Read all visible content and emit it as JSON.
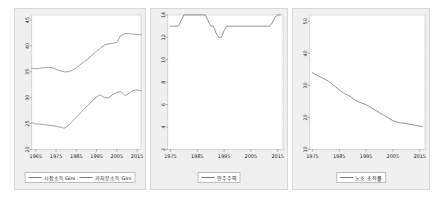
{
  "figure": {
    "panel_count": 3,
    "background_color": "#ffffff",
    "panel_background_color": "#f0f0f0",
    "plot_background_color": "#ffffff",
    "gridline_color": "#ffffff",
    "line_color": "#777777"
  },
  "chart_data": [
    {
      "type": "line",
      "title": "",
      "xlabel": "",
      "ylabel": "",
      "xlim": [
        1963,
        2017
      ],
      "ylim": [
        20,
        46
      ],
      "xticks": [
        1965,
        1975,
        1985,
        1995,
        2005,
        2015
      ],
      "xticklabels": [
        "1965",
        "1975",
        "1985",
        "1995",
        "2005",
        "2015"
      ],
      "yticks": [
        20,
        25,
        30,
        35,
        40,
        45
      ],
      "yticklabels": [
        "20",
        "25",
        "30",
        "35",
        "40",
        "45"
      ],
      "grid": true,
      "legend_position": "below",
      "legend": [
        "시장소득 Gini",
        "가처분소득 Gini"
      ],
      "series": [
        {
          "name": "시장소득 Gini",
          "color": "#8a8a8a",
          "x": [
            1963,
            1965,
            1967,
            1969,
            1971,
            1973,
            1975,
            1977,
            1979,
            1981,
            1983,
            1985,
            1987,
            1989,
            1991,
            1993,
            1995,
            1997,
            1999,
            2001,
            2003,
            2005,
            2007,
            2009,
            2011,
            2013,
            2015,
            2017
          ],
          "values": [
            35.7,
            35.6,
            35.7,
            35.8,
            35.9,
            35.8,
            35.5,
            35.2,
            35.0,
            35.0,
            35.3,
            35.8,
            36.4,
            37.0,
            37.6,
            38.3,
            39.0,
            39.6,
            40.2,
            40.4,
            40.5,
            40.7,
            42.0,
            42.4,
            42.4,
            42.3,
            42.2,
            42.2
          ]
        },
        {
          "name": "가처분소득 Gini",
          "color": "#8a8a8a",
          "x": [
            1963,
            1965,
            1967,
            1969,
            1971,
            1973,
            1975,
            1977,
            1979,
            1981,
            1983,
            1985,
            1987,
            1989,
            1991,
            1993,
            1995,
            1997,
            1999,
            2001,
            2003,
            2005,
            2007,
            2009,
            2011,
            2013,
            2015,
            2017
          ],
          "values": [
            25.2,
            24.9,
            24.9,
            24.8,
            24.7,
            24.6,
            24.5,
            24.3,
            24.1,
            24.6,
            25.4,
            26.2,
            27.0,
            27.9,
            28.6,
            29.4,
            30.2,
            30.5,
            30.0,
            30.0,
            30.6,
            31.0,
            31.2,
            30.4,
            30.8,
            31.4,
            31.5,
            31.3
          ]
        }
      ]
    },
    {
      "type": "line",
      "title": "",
      "xlabel": "",
      "ylabel": "",
      "xlim": [
        1974,
        2017
      ],
      "ylim": [
        2,
        14
      ],
      "xticks": [
        1975,
        1985,
        1995,
        2005,
        2015
      ],
      "xticklabels": [
        "1975",
        "1985",
        "1995",
        "2005",
        "2015"
      ],
      "yticks": [
        2,
        4,
        6,
        8,
        10,
        12,
        14
      ],
      "yticklabels": [
        "2",
        "4",
        "6",
        "8",
        "10",
        "12",
        "14"
      ],
      "grid": true,
      "legend_position": "below",
      "legend": [
        "민주주의"
      ],
      "series": [
        {
          "name": "민주주의",
          "color": "#777777",
          "x": [
            1975,
            1978,
            1979,
            1980,
            1981,
            1988,
            1989,
            1990,
            1991,
            1992,
            1993,
            1994,
            1995,
            1996,
            1997,
            1998,
            2012,
            2013,
            2014,
            2015,
            2016
          ],
          "values": [
            13.0,
            13.0,
            13.5,
            14.0,
            14.0,
            14.0,
            13.5,
            13.0,
            13.0,
            12.4,
            12.0,
            12.0,
            12.6,
            13.0,
            13.0,
            13.0,
            13.0,
            13.3,
            13.8,
            14.0,
            14.0
          ]
        }
      ]
    },
    {
      "type": "line",
      "title": "",
      "xlabel": "",
      "ylabel": "",
      "xlim": [
        1974,
        2017
      ],
      "ylim": [
        10,
        52
      ],
      "xticks": [
        1975,
        1985,
        1995,
        2005,
        2015
      ],
      "xticklabels": [
        "1975",
        "1985",
        "1995",
        "2005",
        "2015"
      ],
      "yticks": [
        10,
        20,
        30,
        40,
        50
      ],
      "yticklabels": [
        "10",
        "20",
        "30",
        "40",
        "50"
      ],
      "grid": true,
      "legend_position": "below",
      "legend": [
        "노조 조직률"
      ],
      "series": [
        {
          "name": "노조 조직률",
          "color": "#777777",
          "x": [
            1975,
            1977,
            1979,
            1981,
            1983,
            1985,
            1987,
            1989,
            1991,
            1993,
            1995,
            1997,
            1999,
            2001,
            2003,
            2005,
            2007,
            2009,
            2011,
            2013,
            2015,
            2016
          ],
          "values": [
            34.0,
            33.0,
            32.2,
            31.3,
            30.0,
            28.6,
            27.4,
            26.6,
            25.4,
            24.6,
            24.0,
            23.0,
            22.0,
            21.0,
            20.0,
            19.0,
            18.4,
            18.2,
            17.9,
            17.6,
            17.3,
            17.2
          ]
        }
      ]
    }
  ]
}
